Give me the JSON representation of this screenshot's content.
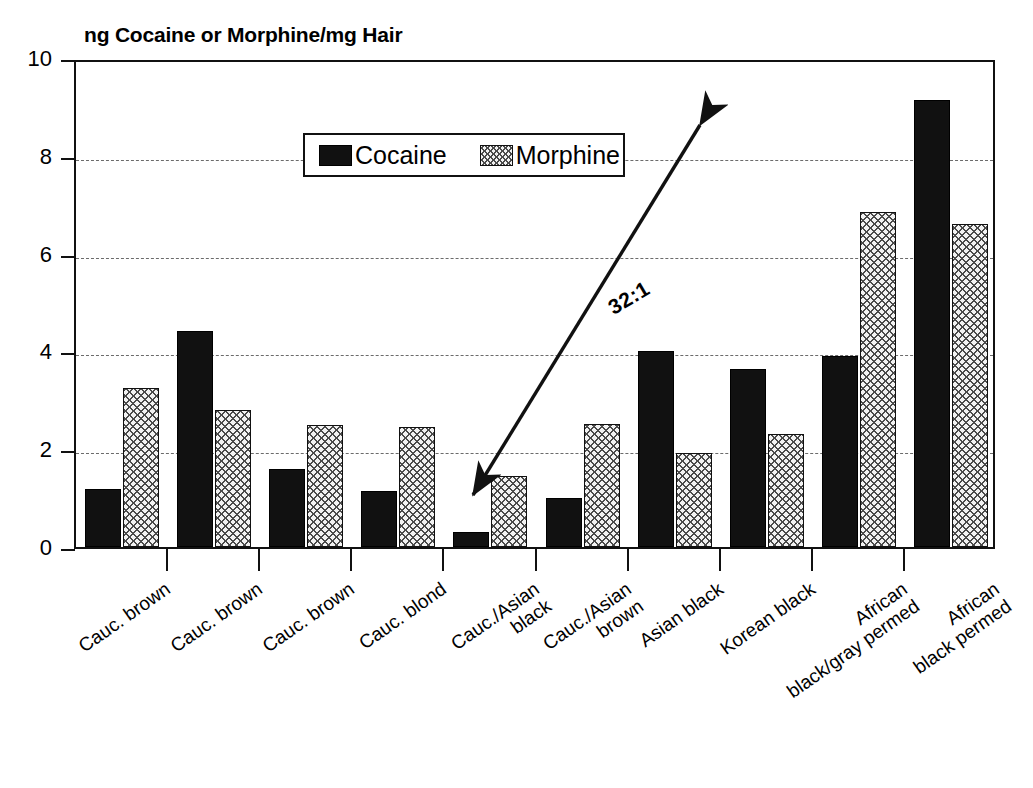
{
  "chart_data": {
    "type": "bar",
    "title": "ng Cocaine or Morphine/mg Hair",
    "xlabel": "",
    "ylabel": "",
    "ylim": [
      0,
      10
    ],
    "yticks": [
      0,
      2,
      4,
      6,
      8,
      10
    ],
    "grid": true,
    "legend_position": "top-center",
    "categories": [
      "Cauc. brown",
      "Cauc. brown",
      "Cauc. brown",
      "Cauc. blond",
      "Cauc./Asian black",
      "Cauc./Asian brown",
      "Asian black",
      "Korean black",
      "African black/gray permed",
      "African black permed"
    ],
    "category_lines": [
      [
        "Cauc. brown"
      ],
      [
        "Cauc. brown"
      ],
      [
        "Cauc. brown"
      ],
      [
        "Cauc. blond"
      ],
      [
        "Cauc./Asian",
        "black"
      ],
      [
        "Cauc./Asian",
        "brown"
      ],
      [
        "Asian black"
      ],
      [
        "Korean black"
      ],
      [
        "African",
        "black/gray permed"
      ],
      [
        "African",
        "black permed"
      ]
    ],
    "series": [
      {
        "name": "Cocaine",
        "fill": "solid-black",
        "color": "#111111",
        "values": [
          1.18,
          4.42,
          1.6,
          1.15,
          0.3,
          1.0,
          4.0,
          3.64,
          3.9,
          9.15
        ]
      },
      {
        "name": "Morphine",
        "fill": "cross-hatch",
        "color": "#f2f2f2",
        "values": [
          3.25,
          2.8,
          2.5,
          2.46,
          1.45,
          2.52,
          1.93,
          2.32,
          6.85,
          6.6
        ]
      }
    ],
    "annotations": [
      {
        "text": "32:1",
        "type": "double-headed-arrow",
        "from": [
          473,
          495
        ],
        "to": [
          700,
          125
        ]
      }
    ]
  },
  "axis": {
    "y_tick_labels": [
      "10",
      "8",
      "6",
      "4",
      "2",
      "0"
    ]
  },
  "legend": {
    "entries": [
      {
        "label": "Cocaine"
      },
      {
        "label": "Morphine"
      }
    ]
  }
}
